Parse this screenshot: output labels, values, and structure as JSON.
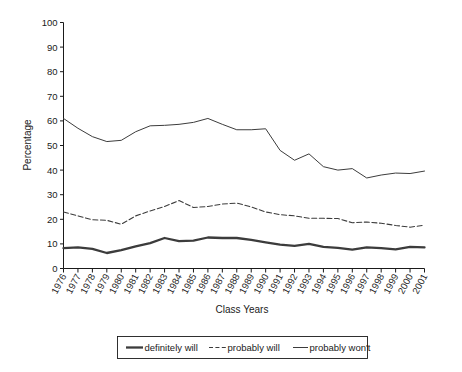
{
  "chart_data": {
    "type": "line",
    "title": "",
    "xlabel": "Class Years",
    "ylabel": "Percentage",
    "ylim": [
      0,
      100
    ],
    "ytick_step": 10,
    "grid": false,
    "legend_position": "bottom",
    "x": [
      1976,
      1977,
      1978,
      1979,
      1980,
      1981,
      1982,
      1983,
      1984,
      1985,
      1986,
      1987,
      1988,
      1989,
      1990,
      1991,
      1992,
      1993,
      1994,
      1995,
      1996,
      1997,
      1998,
      1999,
      2000,
      2001
    ],
    "categories": [
      "1976",
      "1977",
      "1978",
      "1979",
      "1980",
      "1981",
      "1982",
      "1983",
      "1984",
      "1985",
      "1986",
      "1987",
      "1988",
      "1989",
      "1990",
      "1991",
      "1992",
      "1993",
      "1994",
      "1995",
      "1996",
      "1997",
      "1998",
      "1999",
      "2000",
      "2001"
    ],
    "yticks": [
      0,
      10,
      20,
      30,
      40,
      50,
      60,
      70,
      80,
      90,
      100
    ],
    "ytick_labels": [
      "0",
      "10",
      "20",
      "30",
      "40",
      "50",
      "60",
      "70",
      "80",
      "90",
      "100"
    ],
    "series": [
      {
        "name": "definitely will",
        "style": "solid-thick",
        "color": "#2b2b2b",
        "width": 2.3,
        "values": [
          8.3,
          8.6,
          8.0,
          6.3,
          7.5,
          9.0,
          10.3,
          12.4,
          11.1,
          11.3,
          12.6,
          12.4,
          12.4,
          11.6,
          10.6,
          9.7,
          9.2,
          10.0,
          8.8,
          8.4,
          7.7,
          8.6,
          8.3,
          7.8,
          8.8,
          8.6
        ]
      },
      {
        "name": "probably will",
        "style": "dashed",
        "color": "#3c3c3c",
        "width": 1.1,
        "values": [
          23.0,
          21.4,
          19.8,
          19.6,
          18.0,
          21.4,
          23.4,
          25.2,
          27.6,
          24.8,
          25.2,
          26.2,
          26.6,
          25.0,
          23.0,
          21.9,
          21.4,
          20.4,
          20.4,
          20.3,
          18.6,
          18.9,
          18.4,
          17.5,
          16.8,
          17.6
        ]
      },
      {
        "name": "probably won't",
        "style": "solid-thin",
        "color": "#4a4a4a",
        "width": 1.0,
        "values": [
          61.0,
          57.0,
          53.6,
          51.6,
          52.1,
          55.6,
          58.0,
          58.2,
          58.6,
          59.4,
          61.0,
          58.6,
          56.4,
          56.4,
          56.8,
          48.0,
          44.0,
          46.6,
          41.4,
          40.0,
          40.6,
          36.8,
          38.0,
          38.8,
          38.6,
          39.6
        ]
      }
    ]
  },
  "legend": {
    "items": [
      {
        "label": "definitely will",
        "marker": "solid-thick"
      },
      {
        "label": "probably will",
        "marker": "dashed"
      },
      {
        "label": "probably won't",
        "marker": "solid-thin"
      }
    ]
  }
}
